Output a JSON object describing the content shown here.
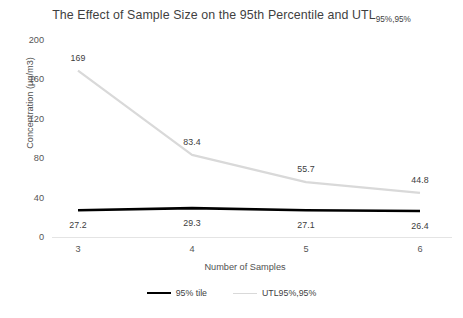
{
  "chart_data": {
    "type": "line",
    "title": "The Effect of Sample Size on the 95th Percentile and UTL",
    "title_subscript": "95%,95%",
    "xlabel": "Number of Samples",
    "ylabel": "Concentration (µg/m3)",
    "categories": [
      "3",
      "4",
      "5",
      "6"
    ],
    "x": [
      3,
      4,
      5,
      6
    ],
    "ylim": [
      0,
      200
    ],
    "yticks": [
      "0",
      "40",
      "80",
      "120",
      "160",
      "200"
    ],
    "ytick_values": [
      0,
      40,
      80,
      120,
      160,
      200
    ],
    "grid": "zero-line-only",
    "legend_position": "bottom",
    "series": [
      {
        "name": "95% tile",
        "color": "#000000",
        "width": 2.6,
        "values": [
          27.2,
          29.3,
          27.1,
          26.4
        ],
        "labels": [
          "27.2",
          "29.3",
          "27.1",
          "26.4"
        ]
      },
      {
        "name": "UTL95%,95%",
        "color": "#d9d9d9",
        "width": 2.2,
        "values": [
          169,
          83.4,
          55.7,
          44.8
        ],
        "labels": [
          "169",
          "83.4",
          "55.7",
          "44.8"
        ]
      }
    ]
  },
  "legend": {
    "items": [
      {
        "label": "95% tile",
        "color": "#000000"
      },
      {
        "label": "UTL95%,95%",
        "color": "#d9d9d9"
      }
    ]
  }
}
